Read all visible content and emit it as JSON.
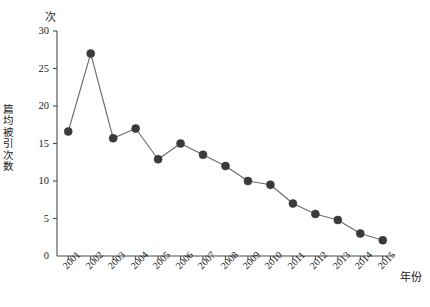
{
  "chart_data": {
    "type": "line",
    "title": "",
    "subtitle": "",
    "xlabel": "年份",
    "ylabel": "篇均被引次数",
    "y_unit_label": "次",
    "categories": [
      "2001",
      "2002",
      "2003",
      "2004",
      "2005",
      "2006",
      "2007",
      "2008",
      "2009",
      "2010",
      "2011",
      "2012",
      "2013",
      "2014",
      "2015"
    ],
    "values": [
      16.6,
      27.0,
      15.7,
      17.0,
      12.9,
      15.0,
      13.5,
      12.0,
      10.0,
      9.5,
      7.0,
      5.6,
      4.8,
      3.0,
      2.1
    ],
    "series": [
      {
        "name": "篇均被引次数",
        "values": [
          16.6,
          27.0,
          15.7,
          17.0,
          12.9,
          15.0,
          13.5,
          12.0,
          10.0,
          9.5,
          7.0,
          5.6,
          4.8,
          3.0,
          2.1
        ]
      }
    ],
    "ylim": [
      0,
      30
    ],
    "y_ticks": [
      0,
      5,
      10,
      15,
      20,
      25,
      30
    ],
    "y_tick_labels": [
      "0",
      "5",
      "10",
      "15",
      "20",
      "25",
      "30"
    ],
    "x_tick_labels": [
      "2001",
      "2002",
      "2003",
      "2004",
      "2005",
      "2006",
      "2007",
      "2008",
      "2009",
      "2010",
      "2011",
      "2012",
      "2013",
      "2014",
      "2015"
    ],
    "x_tick_rotation": -45,
    "grid": false,
    "legend": false,
    "legend_position": "none",
    "marker": "circle",
    "marker_color": "#3a3a3a",
    "line_color": "#6b6b6b",
    "axis_color": "#4a4a4a",
    "background_color": "#ffffff",
    "annotations": []
  },
  "layout": {
    "plot_left": 57,
    "plot_right": 394,
    "plot_top": 31,
    "plot_bottom": 256
  }
}
